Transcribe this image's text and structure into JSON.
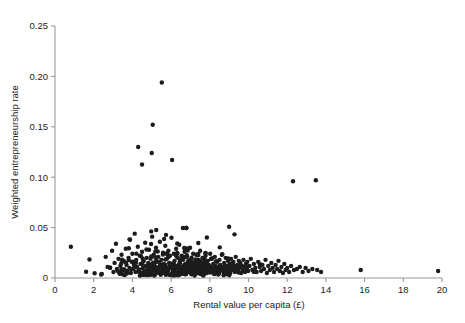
{
  "figure": {
    "top_clipped_text": "",
    "background_color": "#ffffff",
    "point_color": "#1c1c1c",
    "axis_color": "#9a9a9a",
    "text_color": "#232323"
  },
  "chart_data": {
    "type": "scatter",
    "title": "",
    "xlabel": "Rental value per capita (£)",
    "ylabel": "Weighted entrepreneurship rate",
    "xlim": [
      0,
      20
    ],
    "ylim": [
      0,
      0.25
    ],
    "xticks": [
      0,
      2,
      4,
      6,
      8,
      10,
      12,
      14,
      16,
      18,
      20
    ],
    "xticklabels": [
      "0",
      "2",
      "4",
      "6",
      "8",
      "10",
      "12",
      "14",
      "16",
      "18",
      "20"
    ],
    "yticks": [
      0,
      0.05,
      0.1,
      0.15,
      0.2,
      0.25
    ],
    "yticklabels": [
      "0",
      "0.05",
      "0.10",
      "0.15",
      "0.20",
      "0.25"
    ],
    "grid": false,
    "legend": null,
    "marker": "circle",
    "marker_size_px": 4.4,
    "n_points": 520,
    "notable_points": [
      {
        "x": 0.82,
        "y": 0.031,
        "note": "isolated left outlier"
      },
      {
        "x": 5.52,
        "y": 0.194,
        "note": "highest point"
      },
      {
        "x": 5.05,
        "y": 0.152,
        "note": "second highest"
      },
      {
        "x": 4.3,
        "y": 0.13,
        "note": "upper left cluster"
      },
      {
        "x": 5.0,
        "y": 0.124,
        "note": ""
      },
      {
        "x": 6.05,
        "y": 0.117,
        "note": ""
      },
      {
        "x": 12.3,
        "y": 0.096,
        "note": "isolated right-high point"
      },
      {
        "x": 13.48,
        "y": 0.097,
        "note": "isolated right-high point"
      },
      {
        "x": 15.8,
        "y": 0.008,
        "note": "far right low"
      },
      {
        "x": 19.8,
        "y": 0.007,
        "note": "rightmost point"
      }
    ],
    "points": [
      [
        0.82,
        0.031
      ],
      [
        2.42,
        0.004
      ],
      [
        2.62,
        0.021
      ],
      [
        2.72,
        0.011
      ],
      [
        2.85,
        0.01
      ],
      [
        2.95,
        0.027
      ],
      [
        3.02,
        0.006
      ],
      [
        3.08,
        0.015
      ],
      [
        3.15,
        0.034
      ],
      [
        3.2,
        0.009
      ],
      [
        3.28,
        0.019
      ],
      [
        3.33,
        0.005
      ],
      [
        3.38,
        0.012
      ],
      [
        3.44,
        0.023
      ],
      [
        3.5,
        0.008
      ],
      [
        3.55,
        0.017
      ],
      [
        3.6,
        0.003
      ],
      [
        3.66,
        0.029
      ],
      [
        3.7,
        0.013
      ],
      [
        3.74,
        0.007
      ],
      [
        3.8,
        0.02
      ],
      [
        3.85,
        0.01
      ],
      [
        3.88,
        0.038
      ],
      [
        3.92,
        0.005
      ],
      [
        3.96,
        0.016
      ],
      [
        4.0,
        0.024
      ],
      [
        4.04,
        0.009
      ],
      [
        4.08,
        0.013
      ],
      [
        4.12,
        0.044
      ],
      [
        4.16,
        0.006
      ],
      [
        4.2,
        0.018
      ],
      [
        4.24,
        0.011
      ],
      [
        4.28,
        0.031
      ],
      [
        4.3,
        0.13
      ],
      [
        4.34,
        0.008
      ],
      [
        4.38,
        0.022
      ],
      [
        4.42,
        0.014
      ],
      [
        4.46,
        0.005
      ],
      [
        4.5,
        0.026
      ],
      [
        4.54,
        0.01
      ],
      [
        4.58,
        0.017
      ],
      [
        4.62,
        0.007
      ],
      [
        4.66,
        0.035
      ],
      [
        4.7,
        0.012
      ],
      [
        4.74,
        0.02
      ],
      [
        4.78,
        0.009
      ],
      [
        4.82,
        0.015
      ],
      [
        4.86,
        0.028
      ],
      [
        4.9,
        0.006
      ],
      [
        4.94,
        0.019
      ],
      [
        4.98,
        0.011
      ],
      [
        5.0,
        0.124
      ],
      [
        5.02,
        0.041
      ],
      [
        5.05,
        0.152
      ],
      [
        5.06,
        0.008
      ],
      [
        5.1,
        0.023
      ],
      [
        5.14,
        0.013
      ],
      [
        5.18,
        0.005
      ],
      [
        5.22,
        0.03
      ],
      [
        5.26,
        0.016
      ],
      [
        5.3,
        0.01
      ],
      [
        5.34,
        0.021
      ],
      [
        5.38,
        0.007
      ],
      [
        5.42,
        0.036
      ],
      [
        5.46,
        0.012
      ],
      [
        5.5,
        0.018
      ],
      [
        5.52,
        0.194
      ],
      [
        5.54,
        0.009
      ],
      [
        5.58,
        0.025
      ],
      [
        5.62,
        0.014
      ],
      [
        5.66,
        0.006
      ],
      [
        5.7,
        0.032
      ],
      [
        5.74,
        0.011
      ],
      [
        5.78,
        0.019
      ],
      [
        5.82,
        0.008
      ],
      [
        5.86,
        0.027
      ],
      [
        5.9,
        0.015
      ],
      [
        5.94,
        0.022
      ],
      [
        5.98,
        0.01
      ],
      [
        6.02,
        0.04
      ],
      [
        6.05,
        0.117
      ],
      [
        6.06,
        0.013
      ],
      [
        6.1,
        0.007
      ],
      [
        6.14,
        0.024
      ],
      [
        6.18,
        0.017
      ],
      [
        6.22,
        0.005
      ],
      [
        6.26,
        0.029
      ],
      [
        6.3,
        0.012
      ],
      [
        6.34,
        0.02
      ],
      [
        6.38,
        0.009
      ],
      [
        6.42,
        0.033
      ],
      [
        6.46,
        0.015
      ],
      [
        6.5,
        0.006
      ],
      [
        6.54,
        0.022
      ],
      [
        6.58,
        0.011
      ],
      [
        6.62,
        0.018
      ],
      [
        6.66,
        0.008
      ],
      [
        6.7,
        0.026
      ],
      [
        6.74,
        0.014
      ],
      [
        6.78,
        0.004
      ],
      [
        6.82,
        0.021
      ],
      [
        6.86,
        0.01
      ],
      [
        6.9,
        0.017
      ],
      [
        6.94,
        0.007
      ],
      [
        6.98,
        0.03
      ],
      [
        7.02,
        0.013
      ],
      [
        7.06,
        0.019
      ],
      [
        7.1,
        0.009
      ],
      [
        7.14,
        0.024
      ],
      [
        7.18,
        0.012
      ],
      [
        7.22,
        0.005
      ],
      [
        7.26,
        0.016
      ],
      [
        7.3,
        0.023
      ],
      [
        7.34,
        0.008
      ],
      [
        7.38,
        0.011
      ],
      [
        7.42,
        0.018
      ],
      [
        7.46,
        0.006
      ],
      [
        7.5,
        0.027
      ],
      [
        7.54,
        0.014
      ],
      [
        7.58,
        0.009
      ],
      [
        7.62,
        0.02
      ],
      [
        7.66,
        0.012
      ],
      [
        7.7,
        0.007
      ],
      [
        7.74,
        0.015
      ],
      [
        7.78,
        0.022
      ],
      [
        7.82,
        0.01
      ],
      [
        7.86,
        0.005
      ],
      [
        7.9,
        0.017
      ],
      [
        7.94,
        0.013
      ],
      [
        7.98,
        0.008
      ],
      [
        8.02,
        0.024
      ],
      [
        8.06,
        0.011
      ],
      [
        8.1,
        0.019
      ],
      [
        8.14,
        0.006
      ],
      [
        8.18,
        0.014
      ],
      [
        8.22,
        0.009
      ],
      [
        8.26,
        0.021
      ],
      [
        8.3,
        0.012
      ],
      [
        8.34,
        0.007
      ],
      [
        8.38,
        0.016
      ],
      [
        8.42,
        0.01
      ],
      [
        8.46,
        0.005
      ],
      [
        8.5,
        0.018
      ],
      [
        8.54,
        0.013
      ],
      [
        8.58,
        0.008
      ],
      [
        8.62,
        0.023
      ],
      [
        8.66,
        0.011
      ],
      [
        8.7,
        0.006
      ],
      [
        8.74,
        0.015
      ],
      [
        8.78,
        0.009
      ],
      [
        8.82,
        0.02
      ],
      [
        8.86,
        0.012
      ],
      [
        8.9,
        0.007
      ],
      [
        8.94,
        0.017
      ],
      [
        8.98,
        0.01
      ],
      [
        9.02,
        0.014
      ],
      [
        9.06,
        0.005
      ],
      [
        9.1,
        0.019
      ],
      [
        9.14,
        0.011
      ],
      [
        9.18,
        0.008
      ],
      [
        9.22,
        0.016
      ],
      [
        9.26,
        0.012
      ],
      [
        9.3,
        0.006
      ],
      [
        9.34,
        0.021
      ],
      [
        9.38,
        0.009
      ],
      [
        9.42,
        0.013
      ],
      [
        9.46,
        0.007
      ],
      [
        9.5,
        0.017
      ],
      [
        9.54,
        0.01
      ],
      [
        9.58,
        0.015
      ],
      [
        9.62,
        0.005
      ],
      [
        9.66,
        0.012
      ],
      [
        9.7,
        0.008
      ],
      [
        9.74,
        0.018
      ],
      [
        9.78,
        0.011
      ],
      [
        9.82,
        0.006
      ],
      [
        9.86,
        0.014
      ],
      [
        9.9,
        0.009
      ],
      [
        9.94,
        0.016
      ],
      [
        9.98,
        0.007
      ],
      [
        10.05,
        0.012
      ],
      [
        10.12,
        0.019
      ],
      [
        10.2,
        0.008
      ],
      [
        10.28,
        0.014
      ],
      [
        10.35,
        0.01
      ],
      [
        10.42,
        0.006
      ],
      [
        10.5,
        0.016
      ],
      [
        10.58,
        0.011
      ],
      [
        10.65,
        0.007
      ],
      [
        10.72,
        0.013
      ],
      [
        10.8,
        0.009
      ],
      [
        10.88,
        0.018
      ],
      [
        10.95,
        0.005
      ],
      [
        11.02,
        0.012
      ],
      [
        11.1,
        0.008
      ],
      [
        11.18,
        0.015
      ],
      [
        11.25,
        0.01
      ],
      [
        11.32,
        0.006
      ],
      [
        11.4,
        0.013
      ],
      [
        11.48,
        0.009
      ],
      [
        11.55,
        0.017
      ],
      [
        11.62,
        0.007
      ],
      [
        11.7,
        0.011
      ],
      [
        11.78,
        0.005
      ],
      [
        11.85,
        0.014
      ],
      [
        11.92,
        0.008
      ],
      [
        12.0,
        0.01
      ],
      [
        12.1,
        0.006
      ],
      [
        12.2,
        0.012
      ],
      [
        12.3,
        0.096
      ],
      [
        12.35,
        0.008
      ],
      [
        12.5,
        0.009
      ],
      [
        12.65,
        0.011
      ],
      [
        12.8,
        0.006
      ],
      [
        12.95,
        0.01
      ],
      [
        13.1,
        0.007
      ],
      [
        13.3,
        0.009
      ],
      [
        13.48,
        0.097
      ],
      [
        13.55,
        0.008
      ],
      [
        13.75,
        0.006
      ],
      [
        15.8,
        0.008
      ],
      [
        19.8,
        0.007
      ]
    ]
  }
}
